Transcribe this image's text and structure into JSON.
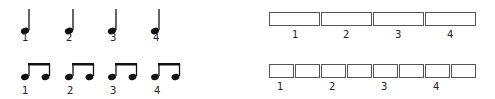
{
  "quarter_notes": {
    "icon": "quarter-note-icon",
    "labels": [
      "1",
      "2",
      "3",
      "4"
    ]
  },
  "eighth_notes": {
    "icon": "beamed-eighth-notes-icon",
    "labels": [
      "1",
      "2",
      "3",
      "4"
    ]
  },
  "quarter_boxes": {
    "count": 4,
    "labels": [
      "1",
      "2",
      "3",
      "4"
    ]
  },
  "eighth_boxes": {
    "count": 8,
    "labels": [
      "1",
      "2",
      "3",
      "4"
    ]
  }
}
